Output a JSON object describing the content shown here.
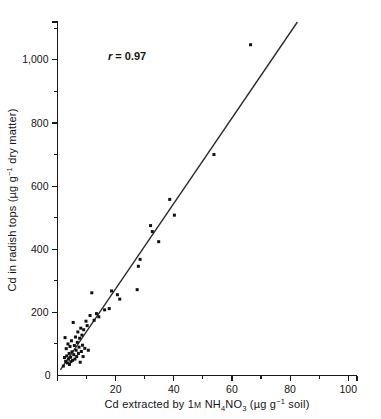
{
  "figure": {
    "background_color": "#ffffff",
    "foreground_color": "#141414"
  },
  "annotation": {
    "r_symbol": "r",
    "r_equals": " = ",
    "r_value": "0.97",
    "full_text": "r = 0.97"
  },
  "axes": {
    "x": {
      "title_parts": {
        "lead": "Cd extracted by ",
        "conc": "1",
        "molar": "M",
        "space": " ",
        "formula_nh": "NH",
        "formula_sub4": "4",
        "formula_no": "NO",
        "formula_sub3": "3",
        "units_open": " (µg g",
        "units_sup": "−1",
        "units_close": " soil)"
      },
      "title_plain": "Cd extracted by 1M NH4NO3 (µg g-1 soil)",
      "major_ticks": [
        0,
        20,
        40,
        60,
        80,
        100
      ],
      "major_tick_labels": [
        "0",
        "20",
        "40",
        "60",
        "80",
        "100"
      ],
      "minor_ticks": [
        10,
        30,
        50,
        70,
        90
      ],
      "range": [
        0,
        103
      ],
      "zero_label": "0"
    },
    "y": {
      "title_parts": {
        "lead": "Cd in radish tops (µg g",
        "units_sup": "−1",
        "tail": " dry matter)"
      },
      "title_plain": "Cd in radish tops (µg g-1 dry matter)",
      "major_ticks": [
        0,
        200,
        400,
        600,
        800,
        1000
      ],
      "major_tick_labels": [
        "0",
        "200",
        "400",
        "600",
        "800",
        "1,000"
      ],
      "minor_ticks": [
        100,
        300,
        500,
        700,
        900,
        1100
      ],
      "range": [
        0,
        1120
      ]
    }
  },
  "chart_data": {
    "type": "scatter",
    "title": "",
    "xlabel": "Cd extracted by 1M NH4NO3 (µg g-1 soil)",
    "ylabel": "Cd in radish tops (µg g-1 dry matter)",
    "xlim": [
      0,
      103
    ],
    "ylim": [
      0,
      1120
    ],
    "grid": false,
    "legend": false,
    "annotations": [
      {
        "text": "r = 0.97",
        "x": 22,
        "y": 1010
      }
    ],
    "correlation_r": 0.97,
    "marker": {
      "shape": "square",
      "size": 3,
      "color": "#111111"
    },
    "series": [
      {
        "name": "Radish tops Cd vs NH4NO3-extractable soil Cd",
        "points": [
          [
            2.0,
            30
          ],
          [
            2.4,
            57
          ],
          [
            2.6,
            120
          ],
          [
            2.8,
            45
          ],
          [
            3.0,
            85
          ],
          [
            3.2,
            62
          ],
          [
            3.4,
            40
          ],
          [
            3.6,
            100
          ],
          [
            3.8,
            52
          ],
          [
            4.0,
            70
          ],
          [
            4.1,
            35
          ],
          [
            4.3,
            92
          ],
          [
            4.5,
            58
          ],
          [
            4.6,
            44
          ],
          [
            4.8,
            110
          ],
          [
            5.0,
            75
          ],
          [
            5.2,
            48
          ],
          [
            5.4,
            168
          ],
          [
            5.6,
            66
          ],
          [
            5.8,
            95
          ],
          [
            6.0,
            52
          ],
          [
            6.2,
            122
          ],
          [
            6.4,
            80
          ],
          [
            6.6,
            60
          ],
          [
            6.8,
            105
          ],
          [
            7.0,
            138
          ],
          [
            7.2,
            70
          ],
          [
            7.4,
            90
          ],
          [
            7.6,
            118
          ],
          [
            7.8,
            42
          ],
          [
            8.0,
            150
          ],
          [
            8.2,
            76
          ],
          [
            8.4,
            128
          ],
          [
            8.6,
            96
          ],
          [
            8.8,
            60
          ],
          [
            9.0,
            145
          ],
          [
            9.4,
            86
          ],
          [
            9.8,
            172
          ],
          [
            10.2,
            158
          ],
          [
            10.6,
            80
          ],
          [
            11.2,
            190
          ],
          [
            11.8,
            262
          ],
          [
            12.6,
            175
          ],
          [
            13.4,
            196
          ],
          [
            14.2,
            186
          ],
          [
            16.2,
            208
          ],
          [
            17.8,
            212
          ],
          [
            18.6,
            268
          ],
          [
            20.6,
            256
          ],
          [
            21.4,
            242
          ],
          [
            27.4,
            272
          ],
          [
            27.8,
            346
          ],
          [
            28.4,
            368
          ],
          [
            32.0,
            475
          ],
          [
            32.6,
            456
          ],
          [
            34.8,
            424
          ],
          [
            38.6,
            558
          ],
          [
            40.2,
            508
          ],
          [
            53.8,
            700
          ],
          [
            66.4,
            1048
          ]
        ]
      }
    ],
    "fit_line": {
      "type": "linear_regression",
      "x_start": 1.0,
      "y_start": 18,
      "x_end": 82.5,
      "y_end": 1120,
      "slope": 13.5,
      "intercept": 4.5
    }
  }
}
